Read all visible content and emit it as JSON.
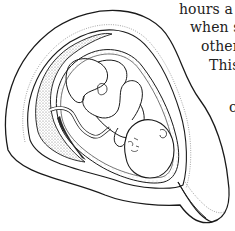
{
  "figure": {
    "style": "black-and-white line drawing with stippled shading",
    "colors": {
      "line": "#1a1a1a",
      "stipple": "#9a9a9a",
      "background": "#ffffff"
    }
  },
  "text_lines": [
    {
      "text": "hours a c",
      "x": 179,
      "y": 2
    },
    {
      "text": "when s",
      "x": 190,
      "y": 20
    },
    {
      "text": "other",
      "x": 201,
      "y": 39
    },
    {
      "text": "This",
      "x": 209,
      "y": 58
    },
    {
      "text": "c",
      "x": 229,
      "y": 100
    }
  ]
}
